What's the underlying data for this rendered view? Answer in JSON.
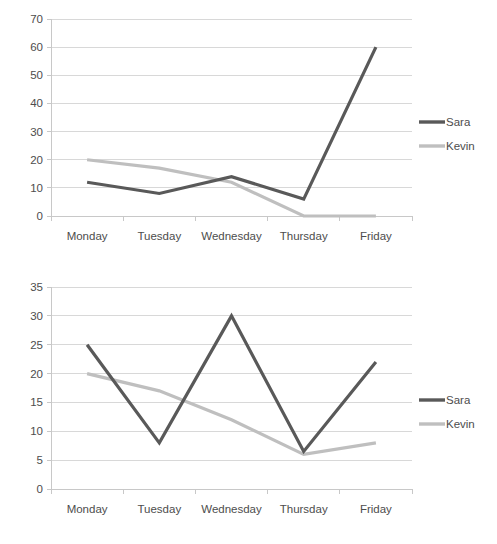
{
  "colors": {
    "sara": "#595959",
    "kevin": "#bfbfbf",
    "gridline": "#d4d4d4",
    "axis": "#c8c8c8",
    "text": "#4d4d4d",
    "background": "#ffffff"
  },
  "charts": [
    {
      "id": "chart-1",
      "legend": {
        "position": "right",
        "entries": [
          "Sara",
          "Kevin"
        ]
      },
      "ticks": [
        "0",
        "10",
        "20",
        "30",
        "40",
        "50",
        "60",
        "70"
      ],
      "categories": [
        "Monday",
        "Tuesday",
        "Wednesday",
        "Thursday",
        "Friday"
      ]
    },
    {
      "id": "chart-2",
      "legend": {
        "position": "right",
        "entries": [
          "Sara",
          "Kevin"
        ]
      },
      "ticks": [
        "0",
        "5",
        "10",
        "15",
        "20",
        "25",
        "30",
        "35"
      ],
      "categories": [
        "Monday",
        "Tuesday",
        "Wednesday",
        "Thursday",
        "Friday"
      ]
    }
  ],
  "chart_data": [
    {
      "type": "line",
      "title": "",
      "xlabel": "",
      "ylabel": "",
      "categories": [
        "Monday",
        "Tuesday",
        "Wednesday",
        "Thursday",
        "Friday"
      ],
      "series": [
        {
          "name": "Sara",
          "values": [
            12,
            8,
            14,
            6,
            60
          ],
          "color": "#595959"
        },
        {
          "name": "Kevin",
          "values": [
            20,
            17,
            12,
            0,
            0
          ],
          "color": "#bfbfbf"
        }
      ],
      "ylim": [
        0,
        70
      ],
      "ytick_step": 10,
      "yticks": [
        0,
        10,
        20,
        30,
        40,
        50,
        60,
        70
      ],
      "grid": true,
      "legend_position": "right"
    },
    {
      "type": "line",
      "title": "",
      "xlabel": "",
      "ylabel": "",
      "categories": [
        "Monday",
        "Tuesday",
        "Wednesday",
        "Thursday",
        "Friday"
      ],
      "series": [
        {
          "name": "Sara",
          "values": [
            25,
            8,
            30,
            6.5,
            22
          ],
          "color": "#595959"
        },
        {
          "name": "Kevin",
          "values": [
            20,
            17,
            12,
            6,
            8
          ],
          "color": "#bfbfbf"
        }
      ],
      "ylim": [
        0,
        35
      ],
      "ytick_step": 5,
      "yticks": [
        0,
        5,
        10,
        15,
        20,
        25,
        30,
        35
      ],
      "grid": true,
      "legend_position": "right"
    }
  ]
}
